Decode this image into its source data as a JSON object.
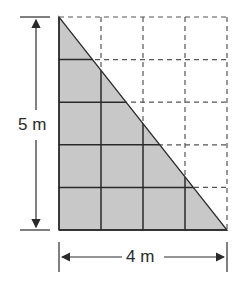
{
  "diagram": {
    "type": "right-triangle-area-grid",
    "grid": {
      "columns": 4,
      "rows": 5,
      "cell_unit": "1 m"
    },
    "triangle": {
      "base": 4,
      "height": 5,
      "unit": "m",
      "fill": "#c8c8c8"
    },
    "labels": {
      "height": "5 m",
      "base": "4 m"
    },
    "colors": {
      "line": "#2a2a2a",
      "dashed": "#555555",
      "fill": "#c8c8c8"
    }
  }
}
